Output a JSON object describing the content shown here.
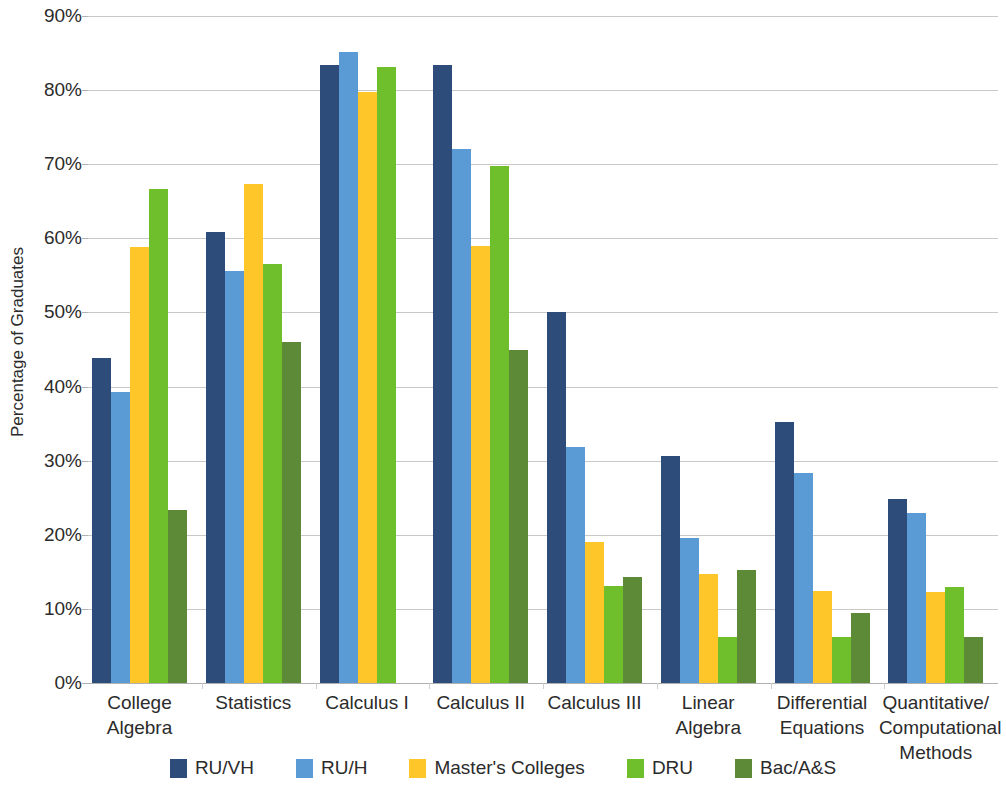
{
  "chart_data": {
    "type": "bar",
    "title": "",
    "xlabel": "",
    "ylabel": "Percentage of Graduates",
    "ylim": [
      0,
      90
    ],
    "ytick_labels": [
      "90%",
      "80%",
      "70%",
      "60%",
      "50%",
      "40%",
      "30%",
      "20%",
      "10%",
      "0%"
    ],
    "ytick_values": [
      90,
      80,
      70,
      60,
      50,
      40,
      30,
      20,
      10,
      0
    ],
    "grid": true,
    "legend_position": "bottom",
    "categories": [
      "College Algebra",
      "Statistics",
      "Calculus I",
      "Calculus II",
      "Calculus III",
      "Linear Algebra",
      "Differential Equations",
      "Quantitative/ Computational Methods"
    ],
    "category_lines": [
      [
        "College",
        "Algebra"
      ],
      [
        "Statistics"
      ],
      [
        "Calculus I"
      ],
      [
        "Calculus II"
      ],
      [
        "Calculus III"
      ],
      [
        "Linear",
        "Algebra"
      ],
      [
        "Differential",
        "Equations"
      ],
      [
        "Quantitative/",
        "Computational",
        "Methods"
      ]
    ],
    "series": [
      {
        "name": "RU/VH",
        "color": "#2E4C79",
        "values": [
          43.8,
          60.8,
          83.4,
          83.4,
          50.0,
          30.6,
          35.2,
          24.8
        ]
      },
      {
        "name": "RU/H",
        "color": "#5B9BD5",
        "values": [
          39.3,
          55.6,
          85.1,
          72.0,
          31.9,
          19.6,
          28.3,
          22.9
        ]
      },
      {
        "name": "Master's Colleges",
        "color": "#FFC629",
        "values": [
          58.8,
          67.4,
          79.7,
          59.0,
          19.0,
          14.7,
          12.4,
          12.3
        ]
      },
      {
        "name": "DRU",
        "color": "#6FBE2B",
        "values": [
          66.6,
          56.6,
          83.1,
          69.7,
          13.1,
          6.2,
          6.2,
          12.9
        ]
      },
      {
        "name": "Bac/A&S",
        "color": "#5D8A36",
        "values": [
          23.4,
          46.0,
          0.0,
          44.9,
          14.3,
          15.2,
          9.4,
          6.2
        ]
      }
    ]
  },
  "colors": {
    "ru_vh": "#2E4C79",
    "ru_h": "#5B9BD5",
    "masters": "#FFC629",
    "dru": "#6FBE2B",
    "bac_as": "#5D8A36",
    "gridline": "#c8c8c8",
    "text": "#2b2b2b",
    "background": "#ffffff"
  }
}
